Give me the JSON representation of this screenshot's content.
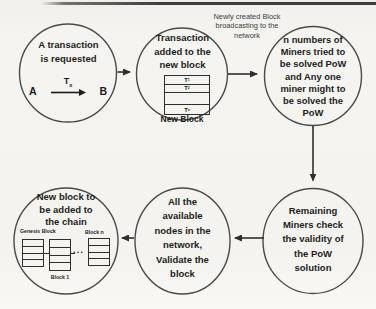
{
  "figure": {
    "annotation": "Newly created Block\nbroadcasting to the\nnetwork"
  },
  "steps": {
    "request": {
      "text": "A transaction\nis requested",
      "sender": "A",
      "receiver": "B",
      "tx_base": "T",
      "tx_sub": "x"
    },
    "add_to_block": {
      "text": "Transaction\nadded to the\nnew block",
      "caption": "New Block",
      "rows": [
        {
          "base": "T",
          "sub": "1"
        },
        {
          "base": "T",
          "sub": "2"
        },
        {
          "base": "T",
          "sub": "n"
        }
      ]
    },
    "mining": {
      "text": "n numbers of\nMiners tried to\nbe solved PoW\nand Any one\nminer might to\nbe solved the\nPoW"
    },
    "validity_check": {
      "text": "Remaining\nMiners check\nthe validity of\nthe PoW\nsolution"
    },
    "network_validation": {
      "text": "All the\navailable\nnodes in the\nnetwork,\nValidate the\nblock"
    },
    "add_to_chain": {
      "text": "New block to\nbe added to\nthe chain",
      "genesis_label": "Genesis Block",
      "block1_label": "Block 1",
      "blockn_label": "Block n",
      "dots": "..."
    }
  },
  "colors": {
    "ink": "#1d1d1d",
    "stroke": "#4a4a4a",
    "background": "#f4f3ef"
  }
}
